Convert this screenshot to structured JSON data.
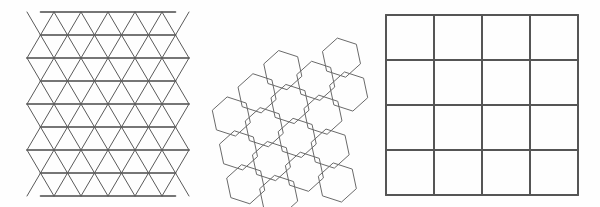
{
  "figure": {
    "background_color": "#fefefe",
    "width": 600,
    "height": 207,
    "panel_count": 3
  },
  "panels": [
    {
      "id": "triangular-tiling",
      "name": "Triangular tiling",
      "shape": "triangle",
      "schlafli": "{3,6}",
      "columns": 6,
      "rows": 8,
      "cell_count": 96,
      "cell_width": 27,
      "cell_height": 23,
      "origin_x": 27,
      "origin_y": 12,
      "line_color": "#5a5a5a",
      "horizontal_line_color": "#4a4a4a",
      "line_width": 1,
      "horizontal_line_width": 1.6,
      "fill": "none"
    },
    {
      "id": "hexagonal-tiling",
      "name": "Hexagonal tiling",
      "shape": "hexagon",
      "schlafli": "{6,3}",
      "orientation": "flat-top",
      "rotation_degrees": -12,
      "hex_count": 17,
      "hex_width": 36,
      "hex_height": 40,
      "center_x": 290,
      "center_y": 104,
      "line_color": "#6a6a6a",
      "line_width": 1,
      "fill": "none"
    },
    {
      "id": "square-tiling",
      "name": "Square tiling",
      "shape": "square",
      "schlafli": "{4,4}",
      "columns": 4,
      "rows": 4,
      "cell_count": 16,
      "cell_size": 48,
      "origin_x": 386,
      "origin_y": 15,
      "extent_x": 578,
      "extent_y": 195,
      "line_color": "#555555",
      "line_width": 2,
      "fill": "none"
    }
  ],
  "colors": {
    "background": "#fefefe",
    "stroke_dark": "#4a4a4a",
    "stroke_medium": "#555555",
    "stroke_light": "#6a6a6a"
  }
}
